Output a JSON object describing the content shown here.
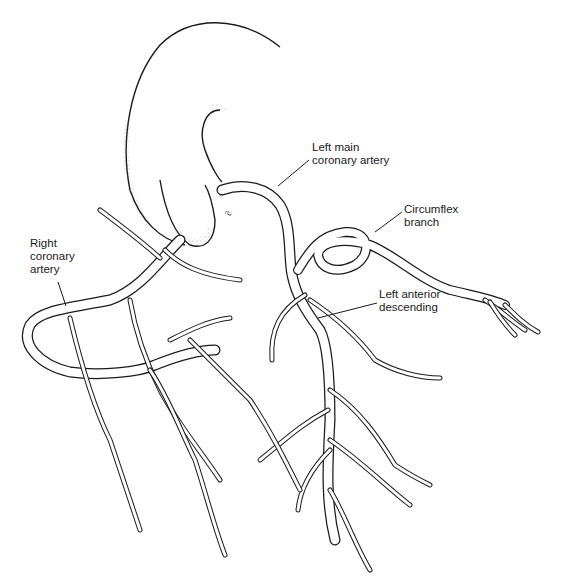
{
  "figure": {
    "labels": [
      {
        "id": "left-main",
        "text": "Left main\ncoronary artery",
        "x": 312,
        "y": 141
      },
      {
        "id": "circumflex",
        "text": "Circumflex\nbranch",
        "x": 404,
        "y": 207
      },
      {
        "id": "right-coronary",
        "text": "Right\ncoronary\nartery",
        "x": 30,
        "y": 237
      },
      {
        "id": "left-anterior-descending",
        "text": "Left anterior\ndescending",
        "x": 379,
        "y": 288
      }
    ],
    "annotation_mark": "∂",
    "colors": {
      "line": "#1a1a1a",
      "background": "#ffffff",
      "stipple": "#555555"
    }
  }
}
